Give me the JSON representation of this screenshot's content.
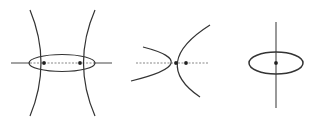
{
  "diagram": {
    "background": "#ffffff",
    "stroke_color": "#333333",
    "axis_color": "#666666",
    "figures": [
      {
        "name": "hyperbola-with-ellipse",
        "description": "two hyperbola branches crossing a horizontal ellipse, dashed segment between two marked points"
      },
      {
        "name": "parabola-pair",
        "description": "two opposing parabolas intersecting on a dashed horizontal axis with two marked points"
      },
      {
        "name": "ellipse-with-vertical-axis",
        "description": "horizontal ellipse pierced by a vertical line with a center point"
      }
    ]
  }
}
